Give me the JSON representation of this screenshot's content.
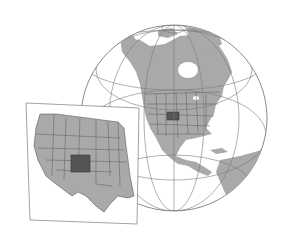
{
  "figure": {
    "type": "locator-map-illustration",
    "globe": {
      "focus": "North America",
      "highlighted_region": "Colorado"
    },
    "inset": {
      "region": "Western United States",
      "highlighted_region": "Colorado"
    },
    "colors": {
      "background": "#ffffff",
      "land": "#a9a9a9",
      "highlight": "#555555",
      "borders": "#5a5a5a",
      "graticule": "#7a7a7a",
      "inset_frame": "#8a8a8a"
    }
  }
}
